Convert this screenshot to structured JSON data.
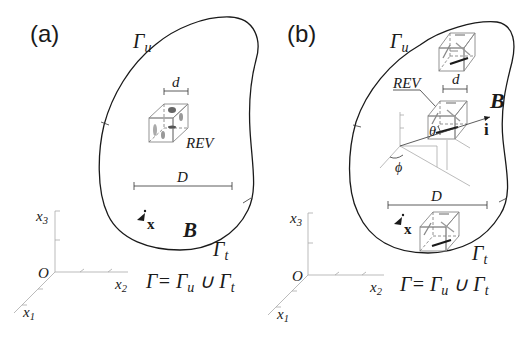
{
  "panels": [
    {
      "label": "(a)",
      "gamma_u": "Γ",
      "gamma_u_sub": "u",
      "gamma_t": "Γ",
      "gamma_t_sub": "t",
      "body_label": "B",
      "rev_label": "REV",
      "rev_size": "d",
      "body_size": "D",
      "point_label": "x",
      "axes": {
        "x1": "x",
        "x1_sub": "1",
        "x2": "x",
        "x2_sub": "2",
        "x3": "x",
        "x3_sub": "3",
        "origin": "O"
      },
      "equation": {
        "lhs": "Γ",
        "eq": "=",
        "a": "Γ",
        "a_sub": "u",
        "union": "∪",
        "b": "Γ",
        "b_sub": "t"
      }
    },
    {
      "label": "(b)",
      "gamma_u": "Γ",
      "gamma_u_sub": "u",
      "gamma_t": "Γ",
      "gamma_t_sub": "t",
      "body_label": "B",
      "rev_label": "REV",
      "rev_size": "d",
      "body_size": "D",
      "point_label": "x",
      "direction_label": "i",
      "theta": "θ",
      "phi": "ϕ",
      "axes": {
        "x1": "x",
        "x1_sub": "1",
        "x2": "x",
        "x2_sub": "2",
        "x3": "x",
        "x3_sub": "3",
        "origin": "O"
      },
      "equation": {
        "lhs": "Γ",
        "eq": "=",
        "a": "Γ",
        "a_sub": "u",
        "union": "∪",
        "b": "Γ",
        "b_sub": "t"
      }
    }
  ],
  "colors": {
    "ink": "#1a1a1a",
    "gray": "#888888",
    "background": "#ffffff"
  }
}
